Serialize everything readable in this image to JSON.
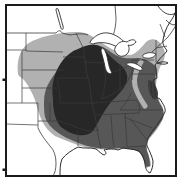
{
  "meta": {
    "figure_type": "grayscale shaded range map",
    "region_shown": "central and eastern United States with southern Canada, Great Lakes, Gulf of Mexico and Atlantic coast",
    "shading_levels": [
      {
        "name": "outer-range",
        "shade": "light gray"
      },
      {
        "name": "middle-range",
        "shade": "medium gray"
      },
      {
        "name": "core-range",
        "shade": "dark gray"
      }
    ],
    "text_labels": []
  },
  "map": {
    "colors": {
      "bg": "#ffffff",
      "frame": "#1b1b1b",
      "line": "#3a3a3a",
      "coast": "#2e2e2e",
      "water": "#ffffff",
      "light": "#b1b1b1",
      "medium": "#575757",
      "dark": "#272727",
      "patch": "#3e3e3e"
    },
    "frame": {
      "x": 6,
      "y": 5,
      "w": 170,
      "h": 171
    },
    "ticks": [
      {
        "x": 2.5,
        "y": 78.5
      },
      {
        "x": 2.5,
        "y": 168.5
      }
    ],
    "layers": [
      {
        "name": "shade-outer-light-region",
        "fill": "light",
        "d": "M 18,74 C 17,66 18,58 21,52 C 24,46 29,42 35,40 C 44,36 54,34 63,33 C 72,32 81,31 88,34 C 96,38 103,44 110,48 C 117,52 124,55 130,55 C 136,54 141,48 146,42 C 149,39 154,38 158,41 C 162,44 164,49 165,53 C 165,58 163,63 160,67 C 158,72 157,78 156,84 C 156,92 158,99 161,104 C 164,109 165,114 163,119 C 160,126 155,132 150,138 C 147,142 146,146 147,150 C 149,156 151,161 151,166 L 146,168 C 144,162 143,156 139,152 C 134,149 127,149 120,149 C 112,150 104,150 97,149 C 89,148 82,147 75,144 C 68,141 61,139 55,136 C 49,132 45,127 42,121 C 39,114 37,107 35,100 C 32,92 28,85 24,80 C 21,77 19,77 18,74 Z"
      },
      {
        "name": "shade-middle-medium-region",
        "fill": "medium",
        "d": "M 44,102 C 44,94 46,87 50,81 C 54,74 59,68 64,62 C 69,56 76,51 83,48 C 90,45 97,44 103,47 C 109,50 114,55 120,57 C 126,59 132,58 138,58 C 144,58 149,61 153,64 C 156,66 157,69 156,73 C 155,79 155,85 156,90 C 157,97 159,103 162,107 C 164,111 164,116 162,120 C 158,127 153,133 148,139 C 146,143 146,147 147,151 C 149,156 150,161 150,166 L 146,167 C 144,161 143,156 139,152 C 134,149 127,148 120,148 C 112,149 104,149 97,148 C 90,147 83,145 76,142 C 69,139 62,136 57,132 C 51,128 47,123 45,117 C 44,112 44,107 44,102 Z"
      },
      {
        "name": "shade-core-dark-region",
        "fill": "dark",
        "d": "M 53,99 C 52,92 52,85 54,78 C 56,71 59,65 63,60 C 67,55 72,51 78,49 C 84,46 90,44 96,45 C 101,46 105,50 108,54 C 111,57 114,60 118,63 C 122,66 126,70 127,75 C 128,80 126,85 123,89 C 119,94 115,98 111,102 C 107,107 104,112 101,117 C 98,122 96,127 93,131 C 89,135 84,136 78,135 C 72,134 66,131 61,127 C 57,123 55,117 54,111 C 53,107 53,103 53,99 Z"
      },
      {
        "name": "appalachian-light-gap-strip",
        "stroke": "light",
        "w": 5,
        "cap": "round",
        "d": "M 141,62 C 136,70 133,78 135,86 C 137,94 141,100 145,106"
      },
      {
        "name": "chesapeake-dark-patch",
        "fill": "patch",
        "d": "M 150,80 C 154,82 157,87 158,93 C 158,98 156,101 153,99 C 150,96 148,90 148,85 C 148,81 148,79 150,80 Z"
      },
      {
        "name": "state-borders-west",
        "stroke": "line",
        "w": 0.7,
        "d": "M 26,33 L 26,51 M 6,50 L 26,50 M 26,51 L 63,52 M 22,51 L 22,103 M 22,70 L 64,70 M 22,88 L 57,88 M 6,103 L 38,103 M 38,103 L 38,128 M 50,103 L 50,121 M 38,121 L 60,121 C 66,124 72,125 78,128 L 88,131 M 6,124 L 38,125"
      },
      {
        "name": "state-borders-midwest",
        "stroke": "line",
        "w": 0.7,
        "d": "M 63,57 L 84,57 M 76,33 C 79,40 83,46 84,51 L 84,57 M 57,78 L 88,78 M 57,78 C 59,87 60,95 60,103 M 60,103 L 92,103 M 84,62 L 104,63 M 104,63 C 106,72 106,82 104,90 C 103,95 102,98 101,99 M 120,64 L 120,90 M 113,72 L 127,67"
      },
      {
        "name": "state-borders-south",
        "stroke": "line",
        "w": 0.7,
        "d": "M 88,131 L 99,130 M 78,131 L 78,146 M 92,103 L 136,100 M 95,115 L 139,113 M 136,100 C 140,104 140,109 139,113 M 111,115 C 112,126 112,137 114,147 M 125,113 L 127,147 M 127,147 L 146,146 M 124,117 L 152,128 M 130,119 C 137,127 142,134 147,140 M 120,110 L 163,110 M 120,110 C 125,104 129,99 131,93"
      },
      {
        "name": "state-borders-northeast",
        "stroke": "line",
        "w": 0.7,
        "d": "M 132,74 L 155,74 M 132,60 L 132,80 M 132,60 L 154,60 M 156,40 L 156,62 M 160,24 L 165,37 M 156,48 L 167,46"
      },
      {
        "name": "rivers-and-canada-border",
        "stroke": "line",
        "w": 0.8,
        "d": "M 6,33 L 56,33 C 58,30 61,30 62,33 L 70,35 C 77,34 83,33 88,35 M 84,57 C 87,64 85,71 88,78 C 91,86 90,95 92,103 C 94,112 96,120 97,128 C 98,137 100,143 101,149 M 101,99 C 108,97 114,94 119,90 C 124,87 128,82 130,76 L 132,72 M 38,128 C 41,135 46,141 50,146 C 54,150 56,156 56,163 C 56,169 55,173 53,176 M 115,5 L 116,18 C 116,24 115,30 113,36 M 152,52 C 158,46 163,42 168,37 C 171,33 174,29 176,25"
      },
      {
        "name": "coastline-atlantic-gulf",
        "stroke": "coast",
        "w": 1,
        "d": "M 170,22 C 166,28 164,34 163,40 C 162,46 166,48 167,51 C 164,55 160,58 158,61 L 155,65 C 157,70 156,74 157,78 L 153,80 C 155,86 154,92 156,97 L 160,99 C 163,104 166,108 165,112 C 162,118 158,124 153,130 C 149,136 146,141 147,146 C 149,150 152,156 153,161 C 153,166 152,170 150,173 C 147,172 145,168 145,163 C 144,158 142,154 139,151 C 134,149 128,149 123,148 L 118,150 C 112,148 108,149 104,150 C 106,152 107,154 104,155 C 101,154 99,151 96,149 C 90,147 84,149 78,147 C 72,150 66,154 62,159 C 60,164 60,170 60,176 M 157,63 C 161,62 165,61 168,63 C 165,65 160,64 157,63 M 151,82 C 152,88 151,94 153,98"
      },
      {
        "name": "canada-maritime-coast-curls",
        "stroke": "coast",
        "w": 0.9,
        "d": "M 158,6 C 162,12 168,16 174,14 C 177,12 178,9 176,6 M 166,20 C 170,24 173,26 176,24 M 170,22 C 173,18 175,14 176,10"
      },
      {
        "name": "lake-superior",
        "fill": "water",
        "stroke": "coast",
        "w": 0.9,
        "d": "M 90,42 C 94,36 101,32 108,33 C 116,34 123,40 128,46 C 125,49 119,48 113,45 C 106,42 98,42 93,44 C 91,44 90,43 90,42 Z"
      },
      {
        "name": "lake-michigan",
        "fill": "water",
        "stroke": "coast",
        "w": 0.9,
        "d": "M 103,48 C 106,51 107,56 108,61 C 109,66 110,70 112,73 C 109,75 106,72 105,67 C 104,61 102,55 101,51 C 101,49 102,48 103,48 Z"
      },
      {
        "name": "lake-huron",
        "fill": "water",
        "stroke": "coast",
        "w": 0.9,
        "d": "M 115,48 C 117,43 122,40 127,42 C 131,39 135,39 136,42 C 134,45 130,46 128,45 C 130,48 129,52 127,54 C 124,57 119,57 117,54 C 115,52 114,50 115,48 Z"
      },
      {
        "name": "lake-erie",
        "fill": "water",
        "stroke": "coast",
        "w": 0.9,
        "d": "M 128,63 C 133,62 138,64 142,68 C 143,70 141,71 138,70 C 133,68 129,66 127,65 C 126,64 127,63 128,63 Z"
      },
      {
        "name": "lake-ontario",
        "fill": "water",
        "stroke": "coast",
        "w": 0.9,
        "d": "M 143,55 C 147,52 152,52 156,54 C 155,57 150,59 146,58 C 143,58 142,56 143,55 Z"
      },
      {
        "name": "lake-winnipeg",
        "fill": "water",
        "stroke": "coast",
        "w": 0.9,
        "d": "M 58,9 C 60,14 61,20 63,26 C 64,29 62,31 61,28 C 59,22 57,14 56,10 C 56,8 57,8 58,9 Z"
      }
    ]
  }
}
